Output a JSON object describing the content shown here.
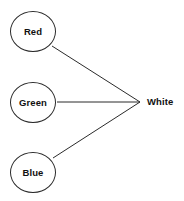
{
  "diagram": {
    "background_color": "#ffffff",
    "stroke_color": "#2b2b2b",
    "text_color": "#111111",
    "nodes": [
      {
        "id": "red",
        "label": "Red",
        "shape": "circle",
        "cx": 33,
        "cy": 31.5,
        "rx": 23,
        "ry": 20.5
      },
      {
        "id": "green",
        "label": "Green",
        "shape": "circle",
        "cx": 33,
        "cy": 102.5,
        "rx": 23,
        "ry": 20.5
      },
      {
        "id": "blue",
        "label": "Blue",
        "shape": "circle",
        "cx": 33,
        "cy": 172.5,
        "rx": 23,
        "ry": 20.5
      },
      {
        "id": "white",
        "label": "White",
        "shape": "text",
        "cx": 162,
        "cy": 102,
        "rx": 0,
        "ry": 0
      }
    ],
    "edges": [
      {
        "id": "edge-red-white",
        "from": "Red",
        "to": "White",
        "x1": 52,
        "y1": 46,
        "x2": 140,
        "y2": 102
      },
      {
        "id": "edge-green-white",
        "from": "Green",
        "to": "White",
        "x1": 57,
        "y1": 102,
        "x2": 140,
        "y2": 102
      },
      {
        "id": "edge-blue-white",
        "from": "Blue",
        "to": "White",
        "x1": 53,
        "y1": 158,
        "x2": 140,
        "y2": 102
      }
    ]
  }
}
